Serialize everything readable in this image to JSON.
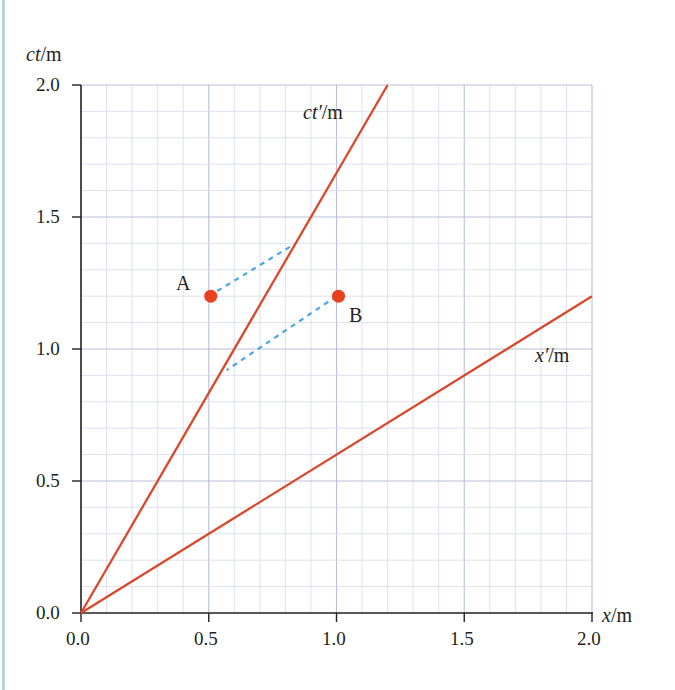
{
  "chart_data": {
    "type": "line",
    "title": "",
    "xlabel": "x/m",
    "ylabel": "ct/m",
    "xlim": [
      0.0,
      2.0
    ],
    "ylim": [
      0.0,
      2.0
    ],
    "x_ticks": [
      "0.0",
      "0.5",
      "1.0",
      "1.5",
      "2.0"
    ],
    "y_ticks": [
      "0.0",
      "0.5",
      "1.0",
      "1.5",
      "2.0"
    ],
    "grid": {
      "on": true,
      "minor_step": 0.1,
      "major_step": 0.5
    },
    "series": [
      {
        "name": "ct'/m",
        "label_x": 0.87,
        "label_y": 1.89,
        "points": [
          [
            0.0,
            0.0
          ],
          [
            1.2,
            2.0
          ]
        ],
        "color": "#d9482b"
      },
      {
        "name": "x'/m",
        "label_x": 1.72,
        "label_y": 0.97,
        "points": [
          [
            0.0,
            0.0
          ],
          [
            2.0,
            1.2
          ]
        ],
        "color": "#d9482b"
      }
    ],
    "events": [
      {
        "name": "A",
        "x": 0.5,
        "ct": 1.2,
        "color": "#e8411e"
      },
      {
        "name": "B",
        "x": 1.0,
        "ct": 1.2,
        "color": "#e8411e"
      }
    ],
    "projections": [
      {
        "from": "A",
        "to": [
          0.84,
          1.4
        ],
        "style": "dashed",
        "color": "#4aa8e0"
      },
      {
        "from": "B",
        "to": [
          0.57,
          0.92
        ],
        "style": "dashed",
        "color": "#4aa8e0"
      }
    ]
  },
  "labels": {
    "y_axis": "ct/m",
    "x_axis": "x/m",
    "ct_prime": "ct′/m",
    "x_prime": "x′/m",
    "point_a": "A",
    "point_b": "B",
    "xt0": "0.0",
    "xt1": "0.5",
    "xt2": "1.0",
    "xt3": "1.5",
    "xt4": "2.0",
    "yt0": "0.0",
    "yt1": "0.5",
    "yt2": "1.0",
    "yt3": "1.5",
    "yt4": "2.0"
  }
}
